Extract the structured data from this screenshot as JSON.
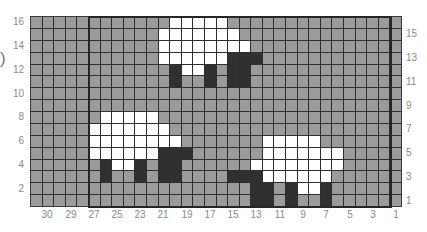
{
  "decoration": {
    "paren": ")"
  },
  "colors": {
    "gray": "#9b9b9b",
    "white": "#ffffff",
    "dark": "#303030",
    "gridline": "#2e2e2e",
    "label": "#8a8a8a"
  },
  "grid": {
    "columns": 32,
    "rows": 16,
    "legend": {
      "g": "gray background cell",
      "w": "white sheep body cell",
      "d": "dark sheep head/leg cell"
    },
    "cells": [
      "ggggggggggggwwwwwggggggggggggggg",
      "gggggggggggwwwwwwwgggggggggggggg",
      "gggggggggggwwwwwwwwggggggggggggg",
      "gggggggggggwwwwwwdddgggggggggggg",
      "ggggggggggggdwwdgddggggggggggggg",
      "ggggggggggggdggdgddggggggggggggg",
      "gggggggggggggggggggggggggggggggg",
      "gggggggggggggggggggggggggggggggg",
      "ggggggwwwwwggggggggggggggggggggg",
      "gggggwwwwwwwgggggggggggggggggggg",
      "gggggwwwwwwwwgggggggwwwwwggggggg",
      "gggggwwwwwwdddggggggwwwwwwwggggg",
      "ggggggdwwdgddggggggwwwwwwwwggggg",
      "ggggggdggdgddggggdddwwwwwwgggggg",
      "gggggggggggggggggggddgdwwdgggggg",
      "gggggggggggggggggggddgdggdgggggg"
    ]
  },
  "labels": {
    "bottom": [
      {
        "text": "30",
        "x": 47
      },
      {
        "text": "29",
        "x": 71
      },
      {
        "text": "27",
        "x": 94
      },
      {
        "text": "25",
        "x": 117
      },
      {
        "text": "23",
        "x": 140
      },
      {
        "text": "21",
        "x": 163
      },
      {
        "text": "19",
        "x": 187
      },
      {
        "text": "17",
        "x": 210
      },
      {
        "text": "15",
        "x": 233
      },
      {
        "text": "13",
        "x": 256
      },
      {
        "text": "11",
        "x": 280
      },
      {
        "text": "9",
        "x": 303
      },
      {
        "text": "7",
        "x": 326
      },
      {
        "text": "5",
        "x": 350
      },
      {
        "text": "3",
        "x": 373
      },
      {
        "text": "1",
        "x": 396
      }
    ],
    "left": [
      {
        "text": "16",
        "row": 0
      },
      {
        "text": "14",
        "row": 2
      },
      {
        "text": "12",
        "row": 4
      },
      {
        "text": "10",
        "row": 6
      },
      {
        "text": "8",
        "row": 8
      },
      {
        "text": "6",
        "row": 10
      },
      {
        "text": "4",
        "row": 12
      },
      {
        "text": "2",
        "row": 14
      }
    ],
    "right": [
      {
        "text": "15",
        "row": 1
      },
      {
        "text": "13",
        "row": 3
      },
      {
        "text": "11",
        "row": 5
      },
      {
        "text": "9",
        "row": 7
      },
      {
        "text": "7",
        "row": 9
      },
      {
        "text": "5",
        "row": 11
      },
      {
        "text": "3",
        "row": 13
      },
      {
        "text": "1",
        "row": 15
      }
    ]
  }
}
